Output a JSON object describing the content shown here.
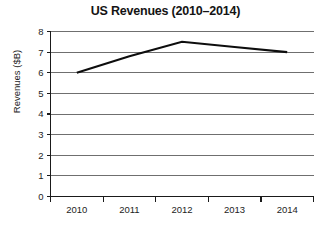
{
  "chart_data": {
    "type": "line",
    "title": "US Revenues (2010–2014)",
    "xlabel": "",
    "ylabel": "Revenues ($B)",
    "categories": [
      "2010",
      "2011",
      "2012",
      "2013",
      "2014"
    ],
    "series": [
      {
        "name": "US Revenues",
        "values": [
          6.0,
          6.8,
          7.5,
          7.25,
          7.0
        ],
        "color": "#0d0d0d"
      }
    ],
    "ylim": [
      0,
      8
    ],
    "y_ticks": [
      "0",
      "1",
      "2",
      "3",
      "4",
      "5",
      "6",
      "7",
      "8"
    ],
    "y_tick_values": [
      0,
      1,
      2,
      3,
      4,
      5,
      6,
      7,
      8
    ],
    "grid": true,
    "grid_axis": "y",
    "legend": false,
    "legend_position": "none",
    "markers": false
  }
}
